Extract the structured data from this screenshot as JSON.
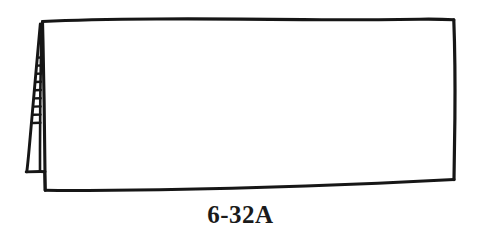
{
  "figure": {
    "caption": "6-32A",
    "ink_color": "#161616",
    "background_color": "#ffffff",
    "line_style": "hand-inked technical line art",
    "parts": [
      {
        "name": "main-panel",
        "description": "large quadrilateral panel, slightly skewed",
        "corners": "top-left (42,21), top-right (454,20), bottom-right (454,180), bottom-left (45,190)"
      },
      {
        "name": "ladder-rail-left",
        "description": "outer rail of folding leg, slanting down-left"
      },
      {
        "name": "ladder-rail-right",
        "description": "inner rail of folding leg, adjacent to panel edge"
      },
      {
        "name": "ladder-rungs",
        "description": "horizontal rungs between the two rails",
        "count": 9,
        "top_y": 57,
        "bottom_y": 125
      },
      {
        "name": "leg-foot",
        "description": "horizontal base bar of the folding leg",
        "y": 172,
        "x_start": 25,
        "x_end": 45
      }
    ],
    "geometry": {
      "panel_top_left_x": 42,
      "panel_top_left_y": 21,
      "panel_top_right_x": 454,
      "panel_top_right_y": 20,
      "panel_bottom_right_x": 454,
      "panel_bottom_right_y": 180,
      "panel_bottom_left_x": 45,
      "panel_bottom_left_y": 190,
      "leg_apex_x": 40,
      "leg_apex_y": 24,
      "leg_foot_left_x": 25,
      "leg_foot_right_x": 45,
      "leg_foot_y": 172
    }
  }
}
